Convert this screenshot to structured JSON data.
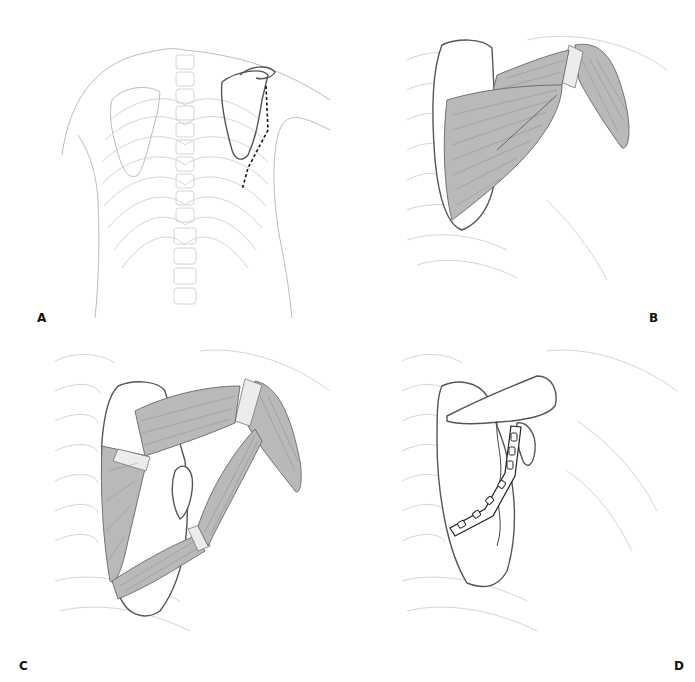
{
  "figure": {
    "panels": [
      {
        "id": "A",
        "label": "A",
        "description": "Posterior view of thorax showing scapulae, ribs and spine with dashed incision line along lateral border of left scapula"
      },
      {
        "id": "B",
        "label": "B",
        "description": "Posterior shoulder showing deltoid and rotator cuff musculature overlying scapula"
      },
      {
        "id": "C",
        "label": "C",
        "description": "Muscles divided and retracted exposing scapular lateral border fracture"
      },
      {
        "id": "D",
        "label": "D",
        "description": "Scapula with fixation plate and screw holes along lateral border"
      }
    ],
    "colors": {
      "background": "#ffffff",
      "line": "#555555",
      "faint_line": "#d4d4d4",
      "muscle": "#b9b9b9",
      "label": "#111111"
    }
  }
}
